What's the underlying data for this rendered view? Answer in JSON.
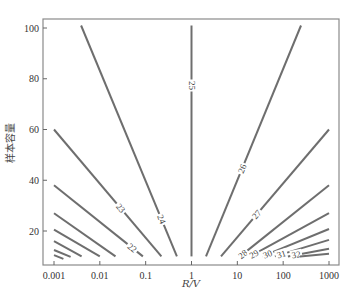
{
  "chart_data": {
    "type": "contour",
    "title": "",
    "xlabel": "R/V",
    "ylabel": "样本容量",
    "xscale": "log",
    "xlim": [
      0.0007,
      2000
    ],
    "ylim": [
      6.5,
      103.5
    ],
    "grid": false,
    "legend": "none",
    "xticks": [
      {
        "value": 0.001,
        "label": "0.001"
      },
      {
        "value": 0.01,
        "label": "0.01"
      },
      {
        "value": 0.1,
        "label": "0.1"
      },
      {
        "value": 1,
        "label": "1"
      },
      {
        "value": 10,
        "label": "10"
      },
      {
        "value": 100,
        "label": "100"
      },
      {
        "value": 1000,
        "label": "1000"
      }
    ],
    "yticks": [
      {
        "value": 20,
        "label": "20"
      },
      {
        "value": 40,
        "label": "40"
      },
      {
        "value": 60,
        "label": "60"
      },
      {
        "value": 80,
        "label": "80"
      },
      {
        "value": 100,
        "label": "100"
      }
    ],
    "contours": [
      {
        "level": "",
        "points": [
          [
            0.001,
            10.5
          ],
          [
            0.0016,
            9
          ]
        ]
      },
      {
        "level": "",
        "points": [
          [
            0.001,
            12.5
          ],
          [
            0.0023,
            9.8
          ]
        ]
      },
      {
        "level": "",
        "points": [
          [
            0.001,
            16
          ],
          [
            0.004,
            10
          ]
        ]
      },
      {
        "level": "",
        "points": [
          [
            0.001,
            20.5
          ],
          [
            0.01,
            10
          ]
        ]
      },
      {
        "level": "",
        "points": [
          [
            0.001,
            27
          ],
          [
            0.022,
            10
          ]
        ]
      },
      {
        "level": "22",
        "points": [
          [
            0.001,
            38
          ],
          [
            0.087,
            10
          ]
        ],
        "label_at": 0.88
      },
      {
        "level": "23",
        "points": [
          [
            0.001,
            60
          ],
          [
            0.22,
            10
          ]
        ],
        "label_at": 0.62
      },
      {
        "level": "24",
        "points": [
          [
            0.0039,
            101
          ],
          [
            0.48,
            10
          ]
        ],
        "label_at": 0.84
      },
      {
        "level": "25",
        "points": [
          [
            1,
            101
          ],
          [
            1,
            10
          ]
        ],
        "label_at": 0.26
      },
      {
        "level": "26",
        "points": [
          [
            2.07,
            10
          ],
          [
            245,
            101
          ]
        ],
        "label_at": 0.38
      },
      {
        "level": "27",
        "points": [
          [
            4.4,
            10
          ],
          [
            1000,
            60
          ]
        ],
        "label_at": 0.33
      },
      {
        "level": "28",
        "points": [
          [
            11.5,
            10
          ],
          [
            1000,
            38
          ]
        ],
        "label_at": 0.03
      },
      {
        "level": "29",
        "points": [
          [
            19,
            10
          ],
          [
            1000,
            27
          ]
        ],
        "label_at": 0.05
      },
      {
        "level": "30",
        "points": [
          [
            35,
            10
          ],
          [
            1000,
            20.8
          ]
        ],
        "label_at": 0.08
      },
      {
        "level": "31",
        "points": [
          [
            66,
            10
          ],
          [
            1000,
            16.5
          ]
        ],
        "label_at": 0.12
      },
      {
        "level": "32",
        "points": [
          [
            127,
            10
          ],
          [
            1000,
            13
          ]
        ],
        "label_at": 0.2
      },
      {
        "level": "",
        "points": [
          [
            233,
            10
          ],
          [
            1000,
            11
          ]
        ]
      }
    ]
  }
}
